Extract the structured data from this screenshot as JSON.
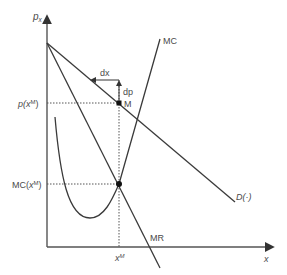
{
  "diagram": {
    "type": "monopoly-pricing",
    "axes": {
      "y_label_base": "p",
      "y_label_sub": "x",
      "x_label": "x"
    },
    "curves": {
      "demand_label": "D(·)",
      "mr_label": "MR",
      "mc_label": "MC"
    },
    "points": {
      "monopoly_point_label": "M"
    },
    "tick_labels": {
      "price_prefix": "p(",
      "price_var": "x",
      "price_sup": "M",
      "price_suffix": ")",
      "mc_prefix": "MC(",
      "mc_var": "x",
      "mc_sup": "M",
      "mc_suffix": ")",
      "quantity_var": "x",
      "quantity_sup": "M"
    },
    "annotations": {
      "dx_label": "dx",
      "dp_label": "dp"
    },
    "colors": {
      "line": "#3a3a3a",
      "text": "#4a4a4a",
      "point": "#111111"
    }
  }
}
